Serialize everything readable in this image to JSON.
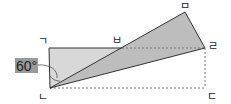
{
  "diagram": {
    "type": "folded-rectangle",
    "points": {
      "giyeok": {
        "label": "ㄱ",
        "x": 49,
        "y": 48
      },
      "nieun": {
        "label": "ㄴ",
        "x": 50,
        "y": 88
      },
      "digeut": {
        "label": "ㄷ",
        "x": 205,
        "y": 88
      },
      "rieul": {
        "label": "ㄹ",
        "x": 205,
        "y": 48
      },
      "mieum": {
        "label": "ㅁ",
        "x": 185,
        "y": 12
      },
      "bieup": {
        "label": "ㅂ",
        "x": 122,
        "y": 48
      }
    },
    "angle": {
      "label": "60°",
      "at": "ㄴ"
    },
    "colors": {
      "unfolded_fill": "#d8d8d8",
      "folded_fill": "#bdbdbd",
      "angle_box": "#9a9a9a",
      "stroke": "#333333",
      "dashed": "#777777"
    }
  }
}
